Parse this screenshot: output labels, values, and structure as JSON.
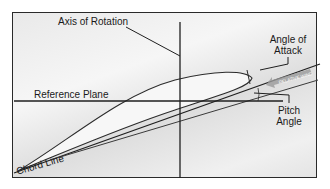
{
  "labels": {
    "axis_of_rotation": "Axis of Rotation",
    "angle_of_attack_line1": "Angle of",
    "angle_of_attack_line2": "Attack",
    "reference_plane": "Reference Plane",
    "pitch_angle_line1": "Pitch",
    "pitch_angle_line2": "Angle",
    "chord_line": "Chord Line",
    "relative_wind": "RELATIVE WIND"
  },
  "colors": {
    "line": "#1f1f1f",
    "frame": "#2a2a2a",
    "arrow": "#9a9a9a",
    "background": "#ececec"
  }
}
